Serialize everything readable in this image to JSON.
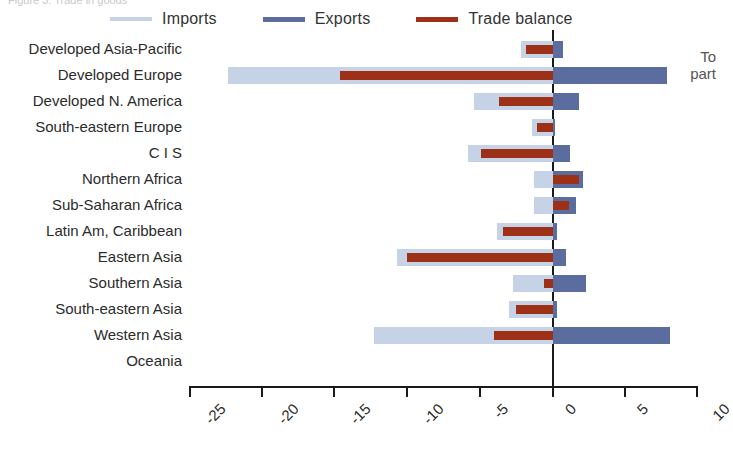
{
  "top_cut_text": "Figure 3. Trade in goods",
  "right_cut_text_line1": "To",
  "right_cut_text_line2": "part",
  "legend": {
    "items": [
      {
        "label": "Imports",
        "color": "#c6d2e6"
      },
      {
        "label": "Exports",
        "color": "#5b6c9e"
      },
      {
        "label": "Trade balance",
        "color": "#9c3118"
      }
    ]
  },
  "colors": {
    "imports": "#c6d2e6",
    "exports": "#5b6c9e",
    "balance": "#9c3118",
    "axis": "#1a1a1a",
    "text": "#2b2b2b"
  },
  "chart_data": {
    "type": "bar",
    "orientation": "horizontal",
    "title": "",
    "xlabel": "",
    "ylabel": "",
    "xlim": [
      -25,
      10
    ],
    "xticks": [
      -25,
      -20,
      -15,
      -10,
      -5,
      0,
      5,
      10
    ],
    "xtick_labels": [
      "-25",
      "-20",
      "-15",
      "-10",
      "-5",
      "0",
      "5",
      "10"
    ],
    "grid": false,
    "legend_position": "top",
    "categories": [
      "Developed Asia-Pacific",
      "Developed Europe",
      "Developed N. America",
      "South-eastern Europe",
      "C I S",
      "Northern Africa",
      "Sub-Saharan Africa",
      "Latin Am, Caribbean",
      "Eastern Asia",
      "Southern Asia",
      "South-eastern Asia",
      "Western Asia",
      "Oceania"
    ],
    "series": [
      {
        "name": "Imports",
        "color": "#c6d2e6",
        "values": [
          -2.2,
          -22.3,
          -5.4,
          -1.4,
          -5.8,
          -1.3,
          -1.3,
          -3.8,
          -10.7,
          -2.7,
          -3.0,
          -12.3,
          0.0
        ]
      },
      {
        "name": "Exports",
        "color": "#5b6c9e",
        "values": [
          0.7,
          7.9,
          1.8,
          0.2,
          1.2,
          2.1,
          1.6,
          0.3,
          0.9,
          2.3,
          0.3,
          8.1,
          0.0
        ]
      },
      {
        "name": "Trade balance",
        "color": "#9c3118",
        "values": [
          -1.8,
          -14.6,
          -3.7,
          -1.1,
          -4.9,
          1.8,
          1.1,
          -3.4,
          -10.0,
          -0.6,
          -2.5,
          -4.0,
          0.0
        ]
      }
    ]
  }
}
